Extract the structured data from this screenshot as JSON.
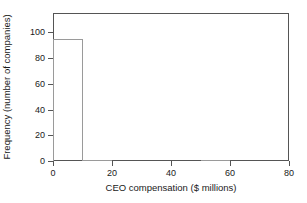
{
  "chart_data": {
    "type": "bar",
    "title": "",
    "xlabel": "CEO compensation ($ millions)",
    "ylabel": "Frequency (number of companies)",
    "bin_width": 10,
    "bin_edges": [
      0,
      10,
      20,
      30,
      40,
      50,
      60,
      70,
      80
    ],
    "categories": [
      "0-10",
      "10-20",
      "20-30",
      "30-40",
      "40-50",
      "50-60",
      "60-70",
      "70-80"
    ],
    "values": [
      95,
      1,
      0,
      0,
      0,
      1,
      0,
      0
    ],
    "xlim": [
      0,
      80
    ],
    "ylim": [
      0,
      115
    ],
    "xticks": [
      0,
      20,
      40,
      60,
      80
    ],
    "xtick_labels": [
      "0",
      "20",
      "40",
      "60",
      "80"
    ],
    "yticks": [
      0,
      20,
      40,
      60,
      80,
      100
    ],
    "ytick_labels": [
      "0",
      "20",
      "40",
      "60",
      "80",
      "100"
    ],
    "grid": false,
    "legend": false,
    "bar_edge_color": "#9a9a9a",
    "bar_fill_color": "none",
    "axis_color": "#555555",
    "background_color": "#ffffff"
  }
}
